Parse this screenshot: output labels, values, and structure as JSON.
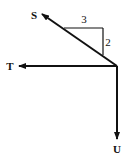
{
  "diagram": {
    "type": "force-vector-diagram",
    "origin": {
      "x": 117,
      "y": 66
    },
    "vectors": [
      {
        "label": "S",
        "direction": "up-left, slope 2:3",
        "tip": {
          "x": 40,
          "y": 13
        },
        "label_pos": {
          "x": 34,
          "y": 18
        }
      },
      {
        "label": "T",
        "direction": "left (horizontal)",
        "tip": {
          "x": 18,
          "y": 66
        },
        "label_pos": {
          "x": 10,
          "y": 70
        }
      },
      {
        "label": "U",
        "direction": "down (vertical)",
        "tip": {
          "x": 117,
          "y": 140
        },
        "label_pos": {
          "x": 117,
          "y": 152
        }
      }
    ],
    "slope_triangle": {
      "horizontal_label": "3",
      "vertical_label": "2"
    },
    "colors": {
      "stroke": "#111111",
      "background": "#ffffff"
    }
  }
}
